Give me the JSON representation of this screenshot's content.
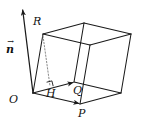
{
  "figure": {
    "type": "geometry-diagram",
    "background_color": "#ffffff",
    "stroke_color": "#1a1a1a",
    "dotted_stroke_color": "#8a8a8a",
    "width": 151,
    "height": 126
  },
  "labels": {
    "normal_vector": "n",
    "normal_vector_accent": "→",
    "origin": "O",
    "point_r": "R",
    "point_q": "Q",
    "point_p": "P",
    "point_h": "H"
  },
  "geometry": {
    "points": {
      "O": [
        33,
        93
      ],
      "P": [
        80,
        104
      ],
      "Q": [
        74,
        82
      ],
      "R": [
        43,
        34
      ],
      "H": [
        50,
        86
      ],
      "base_far": [
        121,
        93
      ],
      "top_O": [
        43,
        34
      ],
      "top_P": [
        90,
        45
      ],
      "top_Q": [
        84,
        23
      ],
      "top_far": [
        131,
        34
      ],
      "n_tip": [
        22,
        7
      ]
    },
    "edges": [
      [
        "O",
        "P"
      ],
      [
        "O",
        "Q"
      ],
      [
        "P",
        "base_far"
      ],
      [
        "Q",
        "base_far"
      ],
      [
        "O",
        "R"
      ],
      [
        "P",
        "top_P"
      ],
      [
        "Q",
        "top_Q"
      ],
      [
        "base_far",
        "top_far"
      ],
      [
        "top_O",
        "top_P"
      ],
      [
        "top_O",
        "top_Q"
      ],
      [
        "top_P",
        "top_far"
      ],
      [
        "top_Q",
        "top_far"
      ]
    ],
    "arrow_edges": [
      [
        "O",
        "P"
      ],
      [
        "O",
        "Q"
      ],
      [
        "O",
        "n_tip"
      ]
    ],
    "dotted_edges": [
      [
        "R",
        "H"
      ]
    ],
    "right_angle_at": "H"
  }
}
